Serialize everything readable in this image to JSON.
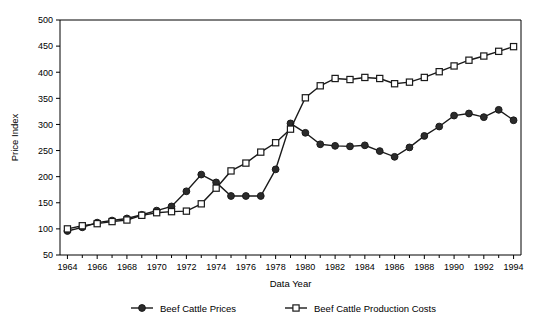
{
  "chart_data": {
    "type": "line",
    "title": "",
    "xlabel": "Data Year",
    "ylabel": "Price Index",
    "xlim": [
      1963.5,
      1994.5
    ],
    "ylim": [
      50,
      500
    ],
    "ytick_values": [
      50,
      100,
      150,
      200,
      250,
      300,
      350,
      400,
      450,
      500
    ],
    "ytick_labels": [
      "50",
      "100",
      "150",
      "200",
      "250",
      "300",
      "350",
      "400",
      "450",
      "500"
    ],
    "xtick_values": [
      1964,
      1966,
      1968,
      1970,
      1972,
      1974,
      1976,
      1978,
      1980,
      1982,
      1984,
      1986,
      1988,
      1990,
      1992,
      1994
    ],
    "xtick_labels": [
      "1964",
      "1966",
      "1968",
      "1970",
      "1972",
      "1974",
      "1976",
      "1978",
      "1980",
      "1982",
      "1984",
      "1986",
      "1988",
      "1990",
      "1992",
      "1994"
    ],
    "minor_xticks": [
      1965,
      1967,
      1969,
      1971,
      1973,
      1975,
      1977,
      1979,
      1981,
      1983,
      1985,
      1987,
      1989,
      1991,
      1993
    ],
    "grid": false,
    "legend_position": "bottom",
    "x": [
      1964,
      1965,
      1966,
      1967,
      1968,
      1969,
      1970,
      1971,
      1972,
      1973,
      1974,
      1975,
      1976,
      1977,
      1978,
      1979,
      1980,
      1981,
      1982,
      1983,
      1984,
      1985,
      1986,
      1987,
      1988,
      1989,
      1990,
      1991,
      1992,
      1993,
      1994
    ],
    "series": [
      {
        "name": "Beef Cattle Prices",
        "marker": "filled-circle",
        "values": [
          96,
          103,
          112,
          116,
          120,
          127,
          135,
          143,
          172,
          204,
          189,
          163,
          163,
          163,
          214,
          302,
          284,
          262,
          259,
          258,
          260,
          249,
          238,
          256,
          278,
          296,
          317,
          321,
          314,
          328,
          308
        ]
      },
      {
        "name": "Beef Cattle Production Costs",
        "marker": "open-square",
        "values": [
          100,
          106,
          110,
          114,
          117,
          126,
          131,
          133,
          134,
          148,
          178,
          211,
          226,
          247,
          265,
          291,
          351,
          374,
          388,
          386,
          390,
          388,
          378,
          381,
          390,
          401,
          412,
          423,
          431,
          440,
          449
        ]
      }
    ]
  },
  "legend": {
    "items": [
      {
        "label": "Beef Cattle Prices",
        "marker": "filled-circle"
      },
      {
        "label": "Beef Cattle Production Costs",
        "marker": "open-square"
      }
    ]
  },
  "colors": {
    "line": "#1a1a1a",
    "marker_fill": "#2b2b2b",
    "marker_open_fill": "#ffffff",
    "axis": "#000000",
    "background": "#ffffff"
  }
}
